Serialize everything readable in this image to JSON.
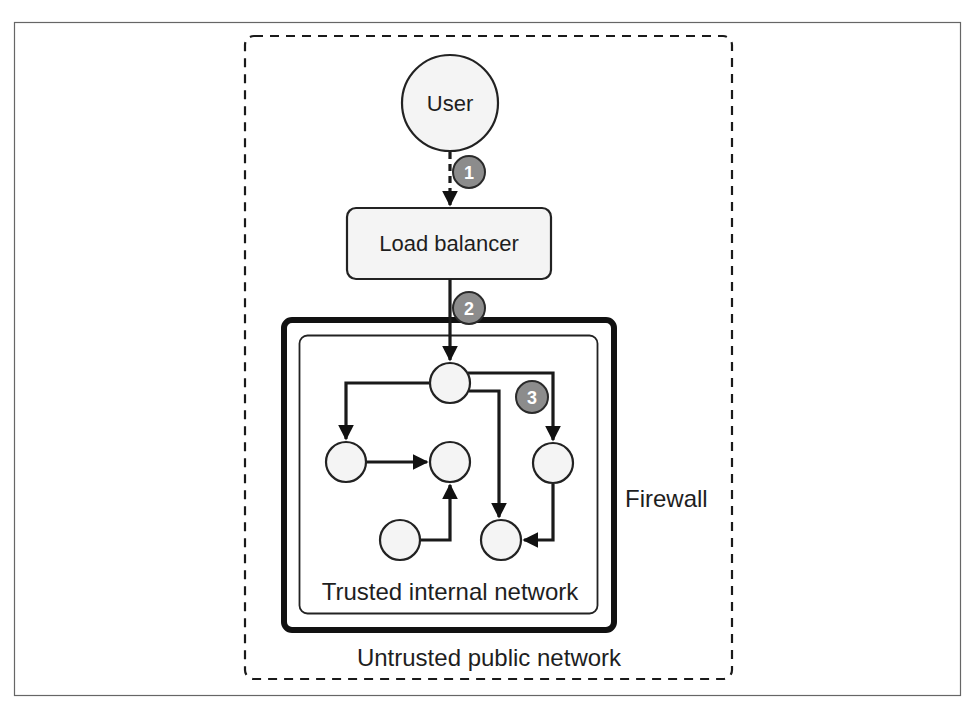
{
  "figure": {
    "frame": {
      "border_color": "#555555"
    }
  },
  "zones": {
    "untrusted": {
      "label": "Untrusted public network",
      "border_style": "dashed"
    },
    "firewall": {
      "label": "Firewall"
    },
    "trusted": {
      "label": "Trusted internal network"
    }
  },
  "nodes": {
    "user": {
      "label": "User"
    },
    "load_balancer": {
      "label": "Load balancer"
    },
    "internal": [
      {
        "id": "entry"
      },
      {
        "id": "left"
      },
      {
        "id": "middle"
      },
      {
        "id": "right"
      },
      {
        "id": "bottom-left"
      },
      {
        "id": "bottom-right"
      }
    ]
  },
  "steps": [
    {
      "number": "1",
      "description": "User to load balancer"
    },
    {
      "number": "2",
      "description": "Load balancer through firewall"
    },
    {
      "number": "3",
      "description": "Internal traffic"
    }
  ],
  "colors": {
    "badge_fill": "#8c8c8c",
    "node_fill": "#f4f4f4",
    "stroke": "#1a1a1a"
  }
}
